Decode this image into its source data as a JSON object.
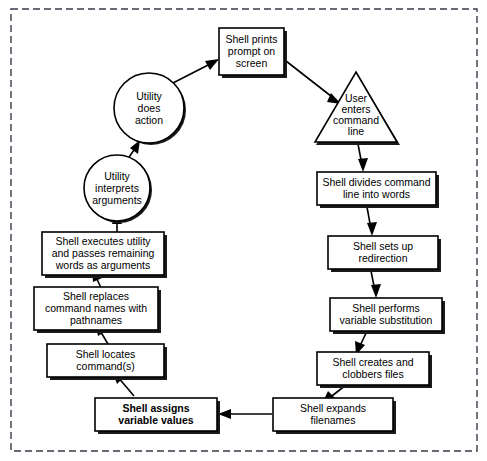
{
  "diagram": {
    "frame": {
      "style": "dashed-border",
      "color": "#3a3a4a"
    },
    "nodes": [
      {
        "id": "shell-prints-prompt",
        "shape": "rectangle",
        "lines": [
          "Shell prints",
          "prompt on",
          "screen"
        ],
        "bold": false
      },
      {
        "id": "user-enters-command-line",
        "shape": "triangle",
        "lines": [
          "User",
          "enters",
          "command",
          "line"
        ],
        "bold": false
      },
      {
        "id": "shell-divides-command-line",
        "shape": "rectangle",
        "lines": [
          "Shell divides command",
          "line into words"
        ],
        "bold": false
      },
      {
        "id": "shell-sets-up-redirection",
        "shape": "rectangle",
        "lines": [
          "Shell sets up",
          "redirection"
        ],
        "bold": false
      },
      {
        "id": "shell-performs-variable-substitution",
        "shape": "rectangle",
        "lines": [
          "Shell performs",
          "variable substitution"
        ],
        "bold": false
      },
      {
        "id": "shell-creates-clobbers-files",
        "shape": "rectangle",
        "lines": [
          "Shell creates and",
          "clobbers files"
        ],
        "bold": false
      },
      {
        "id": "shell-expands-filenames",
        "shape": "rectangle",
        "lines": [
          "Shell expands",
          "filenames"
        ],
        "bold": false
      },
      {
        "id": "shell-assigns-variable-values",
        "shape": "rectangle",
        "lines": [
          "Shell assigns",
          "variable values"
        ],
        "bold": true
      },
      {
        "id": "shell-locates-commands",
        "shape": "rectangle",
        "lines": [
          "Shell locates",
          "command(s)"
        ],
        "bold": false
      },
      {
        "id": "shell-replaces-command-names",
        "shape": "rectangle",
        "lines": [
          "Shell replaces",
          "command names with",
          "pathnames"
        ],
        "bold": false
      },
      {
        "id": "shell-executes-utility",
        "shape": "rectangle",
        "lines": [
          "Shell executes utility",
          "and passes remaining",
          "words as arguments"
        ],
        "bold": false
      },
      {
        "id": "utility-interprets-arguments",
        "shape": "circle",
        "lines": [
          "Utility",
          "interprets",
          "arguments"
        ],
        "bold": false
      },
      {
        "id": "utility-does-action",
        "shape": "circle",
        "lines": [
          "Utility",
          "does",
          "action"
        ],
        "bold": false
      }
    ],
    "edges": [
      {
        "from": "shell-prints-prompt",
        "to": "user-enters-command-line"
      },
      {
        "from": "user-enters-command-line",
        "to": "shell-divides-command-line"
      },
      {
        "from": "shell-divides-command-line",
        "to": "shell-sets-up-redirection"
      },
      {
        "from": "shell-sets-up-redirection",
        "to": "shell-performs-variable-substitution"
      },
      {
        "from": "shell-performs-variable-substitution",
        "to": "shell-creates-clobbers-files"
      },
      {
        "from": "shell-creates-clobbers-files",
        "to": "shell-expands-filenames"
      },
      {
        "from": "shell-expands-filenames",
        "to": "shell-assigns-variable-values"
      },
      {
        "from": "shell-assigns-variable-values",
        "to": "shell-locates-commands"
      },
      {
        "from": "shell-locates-commands",
        "to": "shell-replaces-command-names"
      },
      {
        "from": "shell-replaces-command-names",
        "to": "shell-executes-utility"
      },
      {
        "from": "shell-executes-utility",
        "to": "utility-interprets-arguments"
      },
      {
        "from": "utility-interprets-arguments",
        "to": "utility-does-action"
      },
      {
        "from": "utility-does-action",
        "to": "shell-prints-prompt"
      }
    ]
  }
}
